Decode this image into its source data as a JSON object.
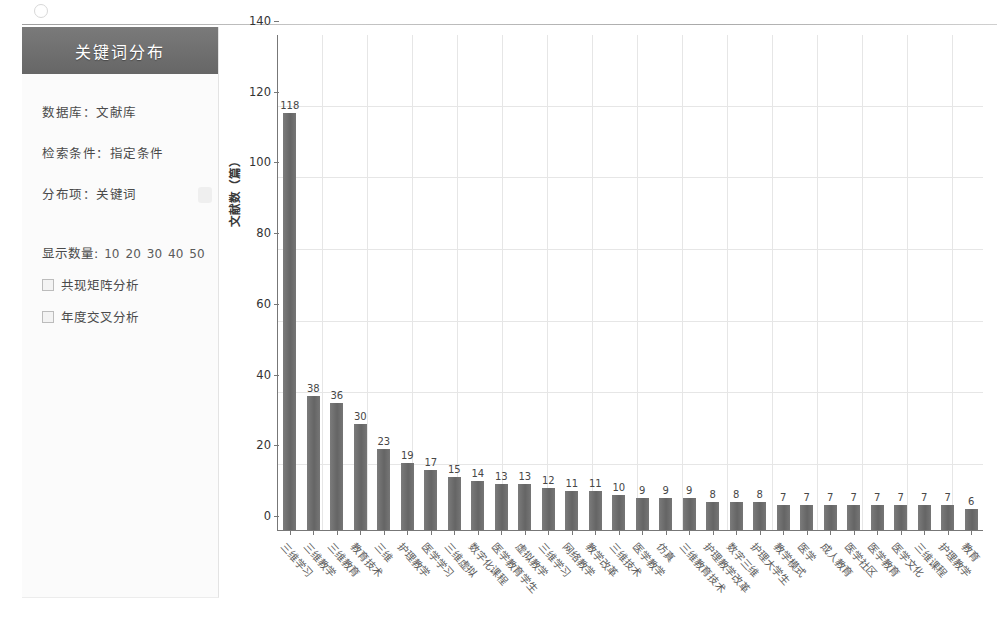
{
  "sidebar": {
    "title": "关键词分布",
    "meta": {
      "database": "数据库：文献库",
      "condition": "检索条件：指定条件",
      "dist_item": "分布项：关键词"
    },
    "count_label": "显示数量:",
    "count_options": [
      "10",
      "20",
      "30",
      "40",
      "50"
    ],
    "tools": [
      {
        "label": "共现矩阵分析"
      },
      {
        "label": "年度交叉分析"
      }
    ]
  },
  "chart_data": {
    "type": "bar",
    "title": "关键词分布",
    "xlabel": "",
    "ylabel": "文献数（篇）",
    "ylim": [
      0,
      140
    ],
    "yticks": [
      0,
      20,
      40,
      60,
      80,
      100,
      120,
      140
    ],
    "grid": true,
    "legend": "none",
    "categories": [
      "三维学习",
      "三维教学",
      "三维教育",
      "教育技术",
      "三维",
      "护理教学",
      "医学学习",
      "三维虚拟",
      "数字化课程",
      "医学教育学生",
      "虚拟教学",
      "三维学习",
      "网络教学",
      "教学改革",
      "三维技术",
      "医学教学",
      "仿真",
      "三维教育技术",
      "护理教学改革",
      "数字三维",
      "护理大学生",
      "教学模式",
      "医学",
      "成人教育",
      "医学社区",
      "医学教育",
      "医学文化",
      "三维课程",
      "护理教学",
      "教育"
    ],
    "values": [
      118,
      38,
      36,
      30,
      23,
      19,
      17,
      15,
      14,
      13,
      13,
      12,
      11,
      11,
      10,
      9,
      9,
      9,
      8,
      8,
      8,
      7,
      7,
      7,
      7,
      7,
      7,
      7,
      7,
      6
    ]
  }
}
